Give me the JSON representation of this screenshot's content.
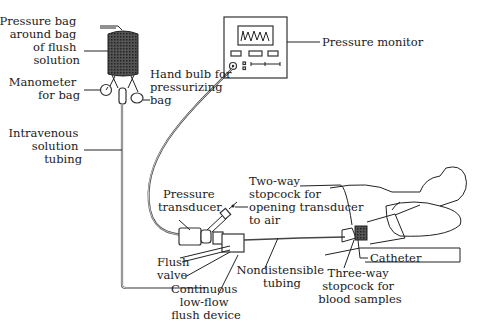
{
  "diagram": {
    "labels": {
      "pressure_bag": [
        "Pressure bag",
        "around bag",
        "of flush",
        "solution"
      ],
      "manometer": [
        "Manometer",
        "for bag"
      ],
      "hand_bulb": [
        "Hand bulb for",
        "pressurizing",
        "bag"
      ],
      "pressure_monitor": [
        "Pressure monitor"
      ],
      "iv_tubing": [
        "Intravenous",
        "solution",
        "tubing"
      ],
      "transducer": [
        "Pressure",
        "transducer"
      ],
      "two_way_stopcock": [
        "Two-way",
        "stopcock for",
        "opening transducer",
        "to air"
      ],
      "flush_valve": [
        "Flush",
        "valve"
      ],
      "flush_device": [
        "Continuous",
        "low-flow",
        "flush device"
      ],
      "nondistensible": [
        "Nondistensible",
        "tubing"
      ],
      "catheter": [
        "Catheter"
      ],
      "three_way_stopcock": [
        "Three-way",
        "stopcock for",
        "blood samples"
      ]
    }
  }
}
